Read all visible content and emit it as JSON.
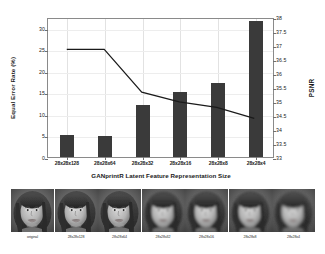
{
  "chart_data": {
    "type": "bar",
    "title": "",
    "xlabel": "GANprintR Latent Feature Representation Size",
    "categories": [
      "28x28x128",
      "28x28x64",
      "28x28x32",
      "28x28x16",
      "28x28x8",
      "28x28x4"
    ],
    "series": [
      {
        "name": "Equal Error Rate (%)",
        "type": "bar",
        "axis": "left",
        "values": [
          5.2,
          4.8,
          12.0,
          15.0,
          17.1,
          31.5
        ],
        "color": "#3a3a3a"
      },
      {
        "name": "PSNR",
        "type": "line",
        "axis": "right",
        "values": [
          36.9,
          36.9,
          35.35,
          35.0,
          34.8,
          34.4
        ],
        "color": "#1a1a1a"
      }
    ],
    "left_axis": {
      "label": "Equal Error Rate (%)",
      "ylim": [
        0,
        32.5
      ],
      "ticks": [
        0,
        5,
        10,
        15,
        20,
        25,
        30
      ],
      "tick_labels": [
        "0",
        "5",
        "10",
        "15",
        "20",
        "25",
        "30"
      ]
    },
    "right_axis": {
      "label": "PSNR",
      "ylim": [
        33,
        38
      ],
      "ticks": [
        33,
        33.5,
        34,
        34.5,
        35,
        35.5,
        36,
        36.5,
        37,
        37.5,
        38
      ],
      "tick_labels": [
        "33",
        "33.5",
        "34",
        "34.5",
        "35",
        "35.5",
        "36",
        "36.5",
        "37",
        "37.5",
        "38"
      ]
    },
    "grid": true,
    "legend": "none"
  },
  "axes": {
    "left_label": "Equal Error Rate (%)",
    "right_label": "PSNR",
    "x_title": "GANprintR Latent Feature Representation Size",
    "left_ticks": [
      "30",
      "25",
      "20",
      "15",
      "10",
      "5",
      "0"
    ],
    "right_ticks": [
      "38",
      "37.5",
      "37",
      "36.5",
      "36",
      "35.5",
      "35",
      "34.5",
      "34",
      "33.5",
      "33"
    ],
    "x_ticks": [
      "28x28x128",
      "28x28x64",
      "28x28x32",
      "28x28x16",
      "28x28x8",
      "28x28x4"
    ]
  },
  "face_strip": {
    "items": [
      {
        "caption": "original"
      },
      {
        "caption": "28x28x128"
      },
      {
        "caption": "28x28x64"
      },
      {
        "caption": "28x28x32"
      },
      {
        "caption": "28x28x16"
      },
      {
        "caption": "28x28x8"
      },
      {
        "caption": "28x28x4"
      }
    ]
  },
  "colors": {
    "bar": "#3a3a3a",
    "line": "#1a1a1a",
    "frame": "#8a8a8a",
    "grid": "#e2e2e2",
    "background": "#ffffff"
  }
}
